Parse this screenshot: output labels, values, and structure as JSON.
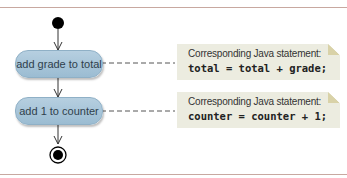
{
  "diagram": {
    "type": "UML activity diagram",
    "actions": [
      {
        "label": "add grade to total"
      },
      {
        "label": "add 1 to counter"
      }
    ],
    "notes": [
      {
        "label": "Corresponding Java statement:",
        "code": "total = total + grade;"
      },
      {
        "label": "Corresponding Java statement:",
        "code": "counter = counter + 1;"
      }
    ],
    "colors": {
      "action_fill": "#a9c6da",
      "note_fill": "#ecece0",
      "rule": "#c8a8a0",
      "node": "#000000"
    }
  }
}
